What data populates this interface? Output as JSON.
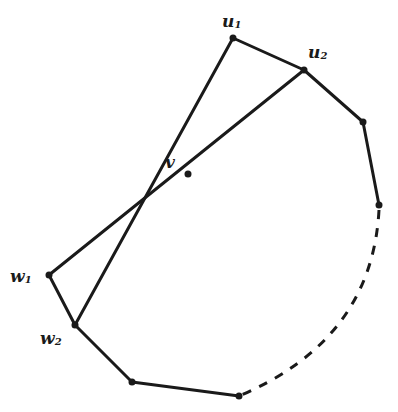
{
  "diagram": {
    "type": "graph",
    "nodes": [
      {
        "id": "u1",
        "label": "u",
        "sub": "1",
        "x": 233,
        "y": 38,
        "lx": 222,
        "ly": 26
      },
      {
        "id": "u2",
        "label": "u",
        "sub": "2",
        "x": 304,
        "y": 70,
        "lx": 308,
        "ly": 57
      },
      {
        "id": "r1",
        "label": "",
        "sub": "",
        "x": 363,
        "y": 122
      },
      {
        "id": "r2",
        "label": "",
        "sub": "",
        "x": 379,
        "y": 205
      },
      {
        "id": "v",
        "label": "v",
        "sub": "",
        "x": 188,
        "y": 174,
        "lx": 164,
        "ly": 167
      },
      {
        "id": "w1",
        "label": "w",
        "sub": "1",
        "x": 49,
        "y": 275,
        "lx": 10,
        "ly": 281
      },
      {
        "id": "w2",
        "label": "w",
        "sub": "2",
        "x": 75,
        "y": 325,
        "lx": 40,
        "ly": 343
      },
      {
        "id": "b1",
        "label": "",
        "sub": "",
        "x": 132,
        "y": 382
      },
      {
        "id": "b2",
        "label": "",
        "sub": "",
        "x": 239,
        "y": 396
      }
    ],
    "labels": {
      "u1": "u",
      "u1_sub": "1",
      "u2": "u",
      "u2_sub": "2",
      "v": "v",
      "w1": "w",
      "w1_sub": "1",
      "w2": "w",
      "w2_sub": "2"
    },
    "edges_solid": [
      [
        "u1",
        "u2"
      ],
      [
        "u2",
        "r1"
      ],
      [
        "r1",
        "r2"
      ],
      [
        "u1",
        "w2"
      ],
      [
        "u2",
        "w1"
      ],
      [
        "w1",
        "w2"
      ],
      [
        "w2",
        "b1"
      ],
      [
        "b1",
        "b2"
      ]
    ],
    "edges_dashed": [
      [
        "r2",
        "b2",
        "arc"
      ]
    ],
    "stroke_color": "#1a1a1a",
    "background": "#ffffff"
  }
}
